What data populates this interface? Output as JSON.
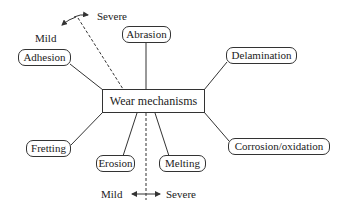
{
  "diagram": {
    "center": {
      "label": "Wear mechanisms"
    },
    "mechanisms": [
      {
        "id": "adhesion",
        "label": "Adhesion"
      },
      {
        "id": "abrasion",
        "label": "Abrasion"
      },
      {
        "id": "delamination",
        "label": "Delamination"
      },
      {
        "id": "fretting",
        "label": "Fretting"
      },
      {
        "id": "erosion",
        "label": "Erosion"
      },
      {
        "id": "melting",
        "label": "Melting"
      },
      {
        "id": "corrosion",
        "label": "Corrosion/oxidation"
      }
    ],
    "top_scale": {
      "mild_label": "Mild",
      "severe_label": "Severe"
    },
    "bottom_scale": {
      "mild_label": "Mild",
      "severe_label": "Severe"
    },
    "colors": {
      "line": "#333333",
      "text": "#222222",
      "background": "#ffffff"
    }
  }
}
